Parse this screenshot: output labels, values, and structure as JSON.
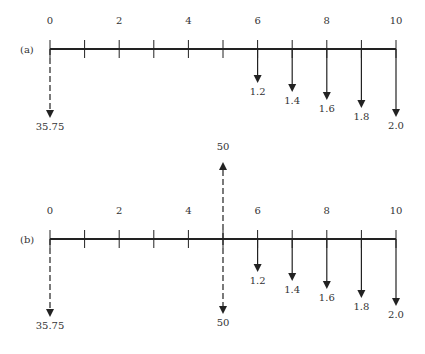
{
  "diagrams": [
    {
      "id": "a",
      "label": "(a)",
      "axis_y": 49,
      "tick_labels": [
        "0",
        "2",
        "4",
        "6",
        "8",
        "10"
      ],
      "flows": [
        {
          "period": 0,
          "value": "35.75",
          "direction": "down",
          "dashed": true,
          "length": 69
        },
        {
          "period": 6,
          "value": "1.2",
          "direction": "down",
          "dashed": false,
          "length": 34
        },
        {
          "period": 7,
          "value": "1.4",
          "direction": "down",
          "dashed": false,
          "length": 43
        },
        {
          "period": 8,
          "value": "1.6",
          "direction": "down",
          "dashed": false,
          "length": 51
        },
        {
          "period": 9,
          "value": "1.8",
          "direction": "down",
          "dashed": false,
          "length": 59
        },
        {
          "period": 10,
          "value": "2.0",
          "direction": "down",
          "dashed": false,
          "length": 68
        }
      ]
    },
    {
      "id": "b",
      "label": "(b)",
      "axis_y": 239,
      "tick_labels": [
        "0",
        "2",
        "4",
        "6",
        "8",
        "10"
      ],
      "flows": [
        {
          "period": 0,
          "value": "35.75",
          "direction": "down",
          "dashed": true,
          "length": 78
        },
        {
          "period": 5,
          "value": "50",
          "direction": "up",
          "dashed": true,
          "length": 77
        },
        {
          "period": 5,
          "value": "50",
          "direction": "down",
          "dashed": true,
          "length": 75
        },
        {
          "period": 6,
          "value": "1.2",
          "direction": "down",
          "dashed": false,
          "length": 33
        },
        {
          "period": 7,
          "value": "1.4",
          "direction": "down",
          "dashed": false,
          "length": 42
        },
        {
          "period": 8,
          "value": "1.6",
          "direction": "down",
          "dashed": false,
          "length": 50
        },
        {
          "period": 9,
          "value": "1.8",
          "direction": "down",
          "dashed": false,
          "length": 59
        },
        {
          "period": 10,
          "value": "2.0",
          "direction": "down",
          "dashed": false,
          "length": 67
        }
      ]
    }
  ],
  "axis": {
    "x_start": 50,
    "x_end": 396,
    "periods": 10,
    "color": "#222222"
  }
}
